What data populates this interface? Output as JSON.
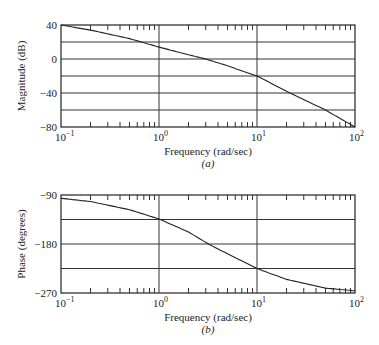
{
  "chart_data": [
    {
      "type": "line",
      "panel_caption": "(a)",
      "title": "",
      "xlabel": "Frequency (rad/sec)",
      "ylabel": "Magnitude (dB)",
      "xscale": "log",
      "xlim": [
        0.1,
        100
      ],
      "ylim": [
        -80,
        40
      ],
      "x_ticks": [
        "10^-1",
        "10^0",
        "10^1",
        "10^2"
      ],
      "y_ticks": [
        "40",
        "0",
        "-40",
        "-80"
      ],
      "y_gridlines": [
        20,
        0,
        -20,
        -40,
        -60
      ],
      "grid": true,
      "series": [
        {
          "name": "Magnitude",
          "x": [
            0.1,
            0.2,
            0.5,
            1,
            2,
            3,
            5,
            10,
            20,
            50,
            100
          ],
          "y": [
            40,
            34,
            24,
            14,
            5,
            0,
            -8,
            -20,
            -38,
            -60,
            -80
          ]
        }
      ]
    },
    {
      "type": "line",
      "panel_caption": "(b)",
      "title": "",
      "xlabel": "Frequency (rad/sec)",
      "ylabel": "Phase (degrees)",
      "xscale": "log",
      "xlim": [
        0.1,
        100
      ],
      "ylim": [
        -270,
        -90
      ],
      "x_ticks": [
        "10^-1",
        "10^0",
        "10^1",
        "10^2"
      ],
      "y_ticks": [
        "-90",
        "-180",
        "-270"
      ],
      "y_gridlines": [
        -135,
        -180,
        -225
      ],
      "grid": true,
      "series": [
        {
          "name": "Phase",
          "x": [
            0.1,
            0.2,
            0.5,
            1,
            2,
            3.2,
            5,
            10,
            20,
            50,
            100
          ],
          "y": [
            -96,
            -102,
            -117,
            -134,
            -158,
            -180,
            -198,
            -225,
            -245,
            -261,
            -266
          ]
        }
      ]
    }
  ],
  "labels": {
    "a": {
      "ylabel": "Magnitude (dB)",
      "xlabel": "Frequency (rad/sec)",
      "caption": "(a)",
      "yticks": [
        "40",
        "0",
        "−40",
        "−80"
      ]
    },
    "b": {
      "ylabel": "Phase (degrees)",
      "xlabel": "Frequency (rad/sec)",
      "caption": "(b)",
      "yticks": [
        "−90",
        "−180",
        "−270"
      ]
    },
    "xtick_base": "10",
    "xtick_exps": [
      "−1",
      "0",
      "1",
      "2"
    ]
  }
}
